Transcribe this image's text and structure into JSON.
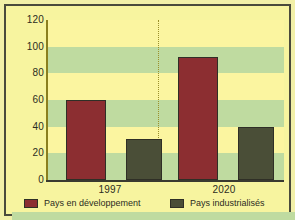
{
  "chart_data": {
    "type": "bar",
    "title": "",
    "subtitle": "",
    "xlabel": "",
    "ylabel": "",
    "categories": [
      "1997",
      "2020"
    ],
    "series": [
      {
        "name": "Pays en développement",
        "color": "#8c2e31",
        "values": [
          60,
          92
        ]
      },
      {
        "name": "Pays industrialisés",
        "color": "#4a4e37",
        "values": [
          31,
          40
        ]
      }
    ],
    "ylim": [
      0,
      120
    ],
    "ytick_labels": [
      "0",
      "20",
      "40",
      "60",
      "80",
      "100",
      "120"
    ],
    "ytick_values": [
      0,
      20,
      40,
      60,
      80,
      100,
      120
    ],
    "xtick_labels": [
      "1997",
      "2020"
    ],
    "grid": "horizontal-bands",
    "legend_position": "bottom",
    "annotations": [
      "dotted vertical divider between the 1997 and 2020 groups"
    ]
  },
  "axes": {
    "y_ticks": [
      {
        "label": "120",
        "value": 120
      },
      {
        "label": "100",
        "value": 100
      },
      {
        "label": "80",
        "value": 80
      },
      {
        "label": "60",
        "value": 60
      },
      {
        "label": "40",
        "value": 40
      },
      {
        "label": "20",
        "value": 20
      },
      {
        "label": "0",
        "value": 0
      }
    ],
    "x_ticks": [
      {
        "label": "1997"
      },
      {
        "label": "2020"
      }
    ]
  },
  "legend": {
    "items": [
      {
        "label": "Pays en développement",
        "color": "#8c2e31",
        "swatch_name": "legend-swatch-developing"
      },
      {
        "label": "Pays industrialisés",
        "color": "#4a4e37",
        "swatch_name": "legend-swatch-industrialized"
      }
    ]
  },
  "colors": {
    "band_light": "#fbf5a0",
    "band_green": "#bfdba0",
    "bar_developing": "#8c2e31",
    "bar_industrialized": "#4a4e37",
    "frame": "#4a4a3c",
    "axis": "#3a3a30",
    "divider": "#9a8f2a",
    "text": "#2c2c22"
  }
}
